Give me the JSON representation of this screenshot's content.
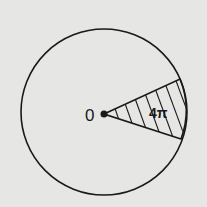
{
  "diagram": {
    "type": "circle-sector",
    "center_label": "0",
    "sector_label": "4π",
    "colors": {
      "background": "#e6e6e4",
      "stroke": "#1a1a1a"
    }
  }
}
